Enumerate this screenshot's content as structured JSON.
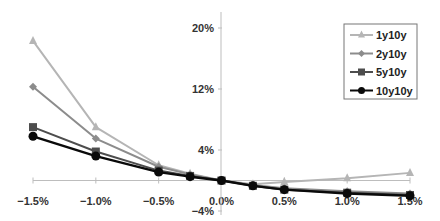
{
  "chart_data": {
    "type": "line",
    "title": "",
    "xlabel": "",
    "ylabel": "",
    "x": [
      -1.5,
      -1.0,
      -0.5,
      -0.25,
      0.0,
      0.25,
      0.5,
      1.0,
      1.5
    ],
    "x_tick_labels": [
      "-1.5%",
      "-1.0%",
      "-0.5%",
      "0.0%",
      "0.5%",
      "1.0%",
      "1.5%"
    ],
    "x_ticks": [
      -1.5,
      -1.0,
      -0.5,
      0.0,
      0.5,
      1.0,
      1.5
    ],
    "y_tick_labels": [
      "20%",
      "12%",
      "4%",
      "-4%"
    ],
    "y_ticks": [
      20,
      12,
      4,
      -4
    ],
    "xlim": [
      -1.5,
      1.5
    ],
    "ylim": [
      -4,
      20
    ],
    "grid": false,
    "legend_position": "upper right",
    "series": [
      {
        "name": "1y10y",
        "color": "#b5b5b5",
        "marker": "triangle",
        "values": [
          18.3,
          7.0,
          2.0,
          0.9,
          0.0,
          -0.5,
          -0.2,
          0.3,
          1.0
        ]
      },
      {
        "name": "2y10y",
        "color": "#8c8c8c",
        "marker": "diamond",
        "values": [
          12.3,
          5.5,
          1.8,
          0.8,
          0.0,
          -0.6,
          -1.0,
          -1.4,
          -1.7
        ]
      },
      {
        "name": "5y10y",
        "color": "#4d4d4d",
        "marker": "square",
        "values": [
          7.0,
          3.8,
          1.3,
          0.6,
          0.0,
          -0.7,
          -1.2,
          -1.6,
          -1.9
        ]
      },
      {
        "name": "10y10y",
        "color": "#0a0a0a",
        "marker": "circle",
        "values": [
          5.8,
          3.2,
          1.1,
          0.5,
          0.0,
          -0.7,
          -1.2,
          -1.7,
          -2.0
        ]
      }
    ]
  },
  "legend": {
    "items": [
      "1y10y",
      "2y10y",
      "5y10y",
      "10y10y"
    ]
  }
}
